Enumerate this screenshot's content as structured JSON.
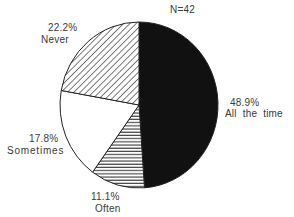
{
  "chart_data": {
    "type": "pie",
    "title": "",
    "annotation": "N=42",
    "start_angle_deg": 0,
    "direction": "clockwise",
    "slices": [
      {
        "label": "All the time",
        "value": 48.9,
        "pct_label": "48.9%",
        "fill": "solid-black",
        "color": "#111111"
      },
      {
        "label": "Often",
        "value": 11.1,
        "pct_label": "11.1%",
        "fill": "horizontal-hatch",
        "color": "#333333"
      },
      {
        "label": "Sometimes",
        "value": 17.8,
        "pct_label": "17.8%",
        "fill": "white",
        "color": "#ffffff"
      },
      {
        "label": "Never",
        "value": 22.2,
        "pct_label": "22.2%",
        "fill": "diagonal-hatch",
        "color": "#333333"
      }
    ],
    "legend": "none (direct labels)"
  },
  "labels": {
    "n": "N=42",
    "all_pct": "48.9%",
    "all_name": "All the time",
    "often_pct": "11.1%",
    "often_name": "Often",
    "sometimes_pct": "17.8%",
    "sometimes_name": "Sometimes",
    "never_pct": "22.2%",
    "never_name": "Never"
  }
}
